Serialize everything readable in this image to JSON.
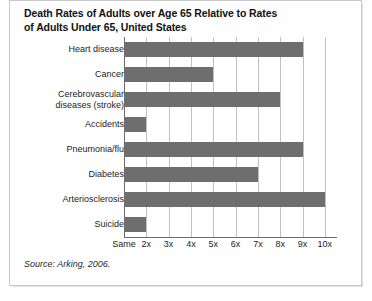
{
  "figure": {
    "title_line1": "Death Rates of Adults over Age 65 Relative to Rates",
    "title_line2": "of Adults Under 65, United States",
    "source": "Source: Arking, 2006."
  },
  "chart_data": {
    "type": "bar",
    "orientation": "horizontal",
    "subtitle": "",
    "xlabel": "",
    "ylabel": "",
    "categories": [
      "Heart disease",
      "Cancer",
      "Cerebrovascular diseases (stroke)",
      "Accidents",
      "Pneumonia/flu",
      "Diabetes",
      "Arteriosclerosis",
      "Suicide"
    ],
    "values": [
      9.0,
      5.0,
      8.0,
      2.0,
      9.0,
      7.0,
      10.0,
      2.0
    ],
    "xlim": [
      1,
      10.5
    ],
    "xticks": [
      1,
      2,
      3,
      4,
      5,
      6,
      7,
      8,
      9,
      10
    ],
    "xticklabels": [
      "Same",
      "2x",
      "3x",
      "4x",
      "5x",
      "6x",
      "7x",
      "8x",
      "9x",
      "10x"
    ],
    "grid": "vertical",
    "legend": "none",
    "bar_color": "#6e6e6e",
    "gridline_color": "#c0c0c0",
    "axis_color": "#6b6b6b"
  }
}
